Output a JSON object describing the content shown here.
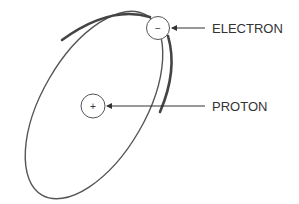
{
  "diagram": {
    "title": "",
    "orbit": {
      "cx": 95,
      "cy": 106,
      "rx": 100,
      "ry": 55,
      "rotation": -62,
      "stroke": "#555555"
    },
    "electron": {
      "label": "ELECTRON",
      "sign": "−",
      "cx": 158,
      "cy": 28,
      "r": 11
    },
    "proton": {
      "label": "PROTON",
      "sign": "+",
      "cx": 93,
      "cy": 106,
      "r": 12
    },
    "colors": {
      "line": "#555555",
      "text": "#333333",
      "background": "#ffffff"
    }
  }
}
